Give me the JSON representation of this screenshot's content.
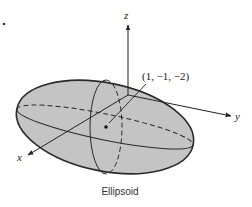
{
  "figure": {
    "title": "Ellipsoid",
    "axes": {
      "x_label": "x",
      "y_label": "y",
      "z_label": "z"
    },
    "point_label": "(1, −1, −2)",
    "colors": {
      "fill": "#c4c4c4",
      "stroke": "#2a2a2a",
      "background": "#ffffff"
    }
  }
}
